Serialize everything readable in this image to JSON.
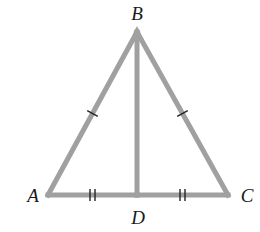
{
  "diagram": {
    "type": "isosceles-triangle-with-altitude",
    "colors": {
      "segment": "#a0a0a0",
      "tick": "#222222",
      "label": "#1a1a1a",
      "background": "#ffffff"
    },
    "points": {
      "A": {
        "label": "A"
      },
      "B": {
        "label": "B"
      },
      "C": {
        "label": "C"
      },
      "D": {
        "label": "D"
      }
    },
    "segments": [
      {
        "id": "AB",
        "from": "A",
        "to": "B",
        "tick_marks": 1
      },
      {
        "id": "BC",
        "from": "B",
        "to": "C",
        "tick_marks": 1
      },
      {
        "id": "AD",
        "from": "A",
        "to": "D",
        "tick_marks": 2
      },
      {
        "id": "DC",
        "from": "D",
        "to": "C",
        "tick_marks": 2
      },
      {
        "id": "BD",
        "from": "B",
        "to": "D",
        "tick_marks": 0
      }
    ],
    "congruences": [
      [
        "AB",
        "BC"
      ],
      [
        "AD",
        "DC"
      ]
    ]
  }
}
